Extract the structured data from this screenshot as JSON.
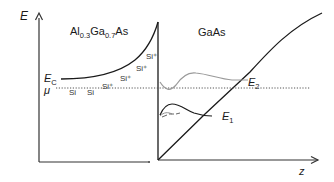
{
  "diagram": {
    "axes": {
      "y_label": "E",
      "x_label": "z"
    },
    "regions": {
      "left": {
        "material_parts": [
          "Al",
          "0.3",
          "Ga",
          "0.7",
          "As"
        ]
      },
      "right": {
        "material": "GaAs"
      }
    },
    "labels": {
      "conduction_band": "E",
      "conduction_band_sub": "C",
      "chemical_potential": "μ",
      "subband_1": "E",
      "subband_1_sub": "1",
      "subband_2": "E",
      "subband_2_sub": "2"
    },
    "dopants": {
      "ionized": [
        "Si⁺",
        "Si⁺",
        "Si⁺",
        "Si⁺"
      ],
      "neutral": [
        "Si",
        "Si"
      ]
    },
    "colors": {
      "line": "#1a1a1a",
      "wavefunction_2": "#9a9a9a",
      "fermi_level": "#555555"
    }
  }
}
